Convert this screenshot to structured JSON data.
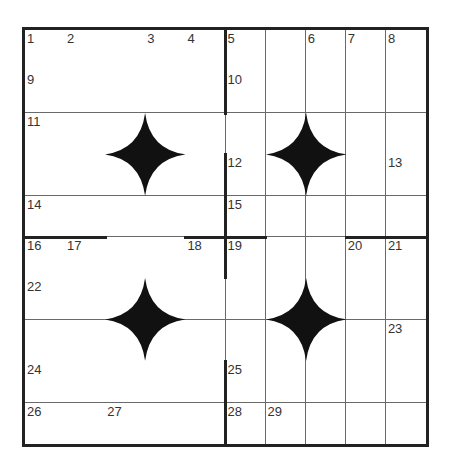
{
  "puzzle": {
    "rows": 10,
    "cols": 10,
    "colors": {
      "grid_line": "#6a6a6a",
      "thick_border": "#222222",
      "star_fill": "#111111",
      "number_text": "#333333",
      "cell_bg": "#ffffff"
    },
    "numbers": [
      {
        "r": 0,
        "c": 0,
        "n": "1"
      },
      {
        "r": 0,
        "c": 1,
        "n": "2"
      },
      {
        "r": 0,
        "c": 3,
        "n": "3"
      },
      {
        "r": 0,
        "c": 4,
        "n": "4"
      },
      {
        "r": 0,
        "c": 5,
        "n": "5"
      },
      {
        "r": 0,
        "c": 7,
        "n": "6"
      },
      {
        "r": 0,
        "c": 8,
        "n": "7"
      },
      {
        "r": 0,
        "c": 9,
        "n": "8"
      },
      {
        "r": 1,
        "c": 0,
        "n": "9"
      },
      {
        "r": 1,
        "c": 5,
        "n": "10"
      },
      {
        "r": 2,
        "c": 0,
        "n": "11"
      },
      {
        "r": 3,
        "c": 5,
        "n": "12"
      },
      {
        "r": 3,
        "c": 9,
        "n": "13"
      },
      {
        "r": 4,
        "c": 0,
        "n": "14"
      },
      {
        "r": 4,
        "c": 5,
        "n": "15"
      },
      {
        "r": 5,
        "c": 0,
        "n": "16"
      },
      {
        "r": 5,
        "c": 1,
        "n": "17"
      },
      {
        "r": 5,
        "c": 4,
        "n": "18"
      },
      {
        "r": 5,
        "c": 5,
        "n": "19"
      },
      {
        "r": 5,
        "c": 8,
        "n": "20"
      },
      {
        "r": 5,
        "c": 9,
        "n": "21"
      },
      {
        "r": 6,
        "c": 0,
        "n": "22"
      },
      {
        "r": 7,
        "c": 9,
        "n": "23"
      },
      {
        "r": 8,
        "c": 0,
        "n": "24"
      },
      {
        "r": 8,
        "c": 5,
        "n": "25"
      },
      {
        "r": 9,
        "c": 0,
        "n": "26"
      },
      {
        "r": 9,
        "c": 2,
        "n": "27"
      },
      {
        "r": 9,
        "c": 5,
        "n": "28"
      },
      {
        "r": 9,
        "c": 6,
        "n": "29"
      }
    ],
    "stars": [
      {
        "center_r": 3,
        "center_c": 3
      },
      {
        "center_r": 3,
        "center_c": 7
      },
      {
        "center_r": 7,
        "center_c": 3
      },
      {
        "center_r": 7,
        "center_c": 7
      }
    ],
    "thick_vertical": [
      {
        "col_line": 5,
        "row_start": 0,
        "row_end": 2
      },
      {
        "col_line": 5,
        "row_start": 3,
        "row_end": 6
      },
      {
        "col_line": 5,
        "row_start": 8,
        "row_end": 10
      }
    ],
    "thick_horizontal": [
      {
        "row_line": 5,
        "col_start": 0,
        "col_end": 2
      },
      {
        "row_line": 5,
        "col_start": 4,
        "col_end": 6
      },
      {
        "row_line": 5,
        "col_start": 8,
        "col_end": 10
      }
    ]
  }
}
